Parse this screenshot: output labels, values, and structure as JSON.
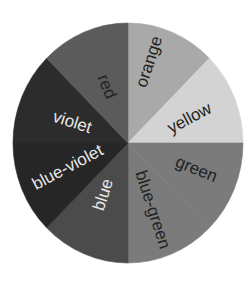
{
  "diagram": {
    "type": "color-wheel",
    "center": [
      128,
      143
    ],
    "radius": [
      115,
      120
    ],
    "segments": [
      {
        "name": "orange",
        "label": "orange",
        "start": 0,
        "end": 45,
        "fill": "#a9a9a9",
        "text_color": "#222222",
        "label_pos": [
          150,
          62
        ],
        "label_rot": -72
      },
      {
        "name": "yellow",
        "label": "yellow",
        "start": 45,
        "end": 90,
        "fill": "#d3d3d3",
        "text_color": "#222222",
        "label_pos": [
          190,
          119
        ],
        "label_rot": -28
      },
      {
        "name": "green",
        "label": "green",
        "start": 90,
        "end": 135,
        "fill": "#7b7b7b",
        "text_color": "#222222",
        "label_pos": [
          196,
          170
        ],
        "label_rot": 22
      },
      {
        "name": "blue-green",
        "label": "blue-green",
        "start": 135,
        "end": 180,
        "fill": "#7b7b7b",
        "text_color": "#222222",
        "label_pos": [
          152,
          210
        ],
        "label_rot": 72
      },
      {
        "name": "blue",
        "label": "blue",
        "start": 180,
        "end": 225,
        "fill": "#4b4b4b",
        "text_color": "#e8e8e8",
        "label_pos": [
          104,
          195
        ],
        "label_rot": -72
      },
      {
        "name": "blue-violet",
        "label": "blue-violet",
        "start": 225,
        "end": 270,
        "fill": "#262626",
        "text_color": "#e8e8e8",
        "label_pos": [
          68,
          168
        ],
        "label_rot": -28
      },
      {
        "name": "violet",
        "label": "violet",
        "start": 270,
        "end": 315,
        "fill": "#2c2c2c",
        "text_color": "#e8e8e8",
        "label_pos": [
          72,
          123
        ],
        "label_rot": 18
      },
      {
        "name": "red",
        "label": "red",
        "start": 315,
        "end": 360,
        "fill": "#5b5b5b",
        "text_color": "#222222",
        "label_pos": [
          106,
          87
        ],
        "label_rot": 68
      }
    ]
  }
}
